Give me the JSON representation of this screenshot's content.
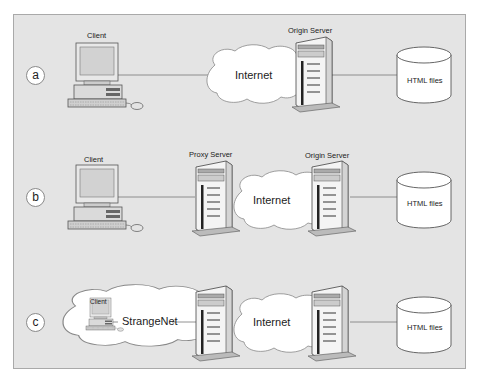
{
  "diagram": {
    "background": "#e4e4e4",
    "rows": [
      {
        "id": "a",
        "label": "a",
        "nodes": {
          "client": "Client",
          "cloud": "Internet",
          "server": "Origin Server",
          "storage": "HTML files"
        },
        "connections": [
          [
            "Client",
            "Internet"
          ],
          [
            "Internet",
            "Origin Server"
          ],
          [
            "Origin Server",
            "HTML files"
          ]
        ]
      },
      {
        "id": "b",
        "label": "b",
        "nodes": {
          "client": "Client",
          "proxy": "Proxy Server",
          "cloud": "Internet",
          "server": "Origin Server",
          "storage": "HTML files"
        },
        "connections": [
          [
            "Client",
            "Proxy Server"
          ],
          [
            "Proxy Server",
            "Internet"
          ],
          [
            "Internet",
            "Origin Server"
          ],
          [
            "Origin Server",
            "HTML files"
          ]
        ]
      },
      {
        "id": "c",
        "label": "c",
        "nodes": {
          "client": "Client",
          "local_cloud": "StrangeNet",
          "cloud": "Internet",
          "storage": "HTML files"
        },
        "connections": [
          [
            "Client",
            "StrangeNet"
          ],
          [
            "StrangeNet",
            "Proxy Server"
          ],
          [
            "Proxy Server",
            "Internet"
          ],
          [
            "Internet",
            "Origin Server"
          ],
          [
            "Origin Server",
            "HTML files"
          ]
        ]
      }
    ]
  }
}
